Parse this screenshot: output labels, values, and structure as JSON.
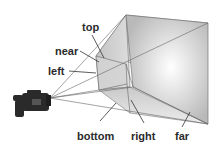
{
  "diagram": {
    "labels": {
      "top": "top",
      "near": "near",
      "left": "left",
      "bottom": "bottom",
      "right": "right",
      "far": "far"
    },
    "icons": {
      "camera": "video-camera-icon"
    },
    "colors": {
      "background": "#ffffff",
      "line": "#555555",
      "label_text": "#2b2b2b",
      "far_plane_center": "#ffffff",
      "far_plane_edge": "#b8b8b8",
      "side_face": "#cfcfcf",
      "near_plane": "#d6d6d6",
      "camera_body": "#2a2a2a"
    }
  }
}
